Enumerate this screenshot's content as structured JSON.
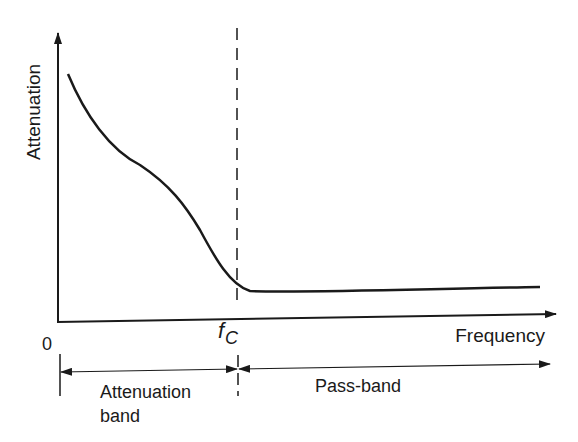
{
  "diagram": {
    "type": "filter attenuation characteristic (high-pass)",
    "y_axis_label": "Attenuation",
    "x_axis_label": "Frequency",
    "origin_label": "0",
    "cutoff_label": "f",
    "cutoff_subscript": "C",
    "bands": [
      {
        "label_line1": "Attenuation",
        "label_line2": "band"
      },
      {
        "label_line1": "Pass-band"
      }
    ],
    "colors": {
      "ink": "#1a1a1a",
      "background": "#ffffff"
    }
  }
}
